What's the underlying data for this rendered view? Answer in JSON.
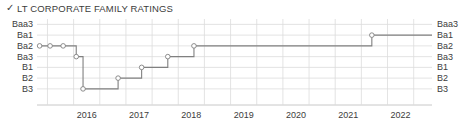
{
  "title": {
    "check_icon": "✓",
    "text": "LT CORPORATE FAMILY RATINGS"
  },
  "colors": {
    "line": "#808080",
    "marker_fill": "#ffffff",
    "marker_stroke": "#808080",
    "grid": "#dcdcdc",
    "axis": "#c8c8c8",
    "text": "#3c3c3c"
  },
  "chart_data": {
    "type": "line",
    "title": "LT CORPORATE FAMILY RATINGS",
    "xlabel": "",
    "ylabel": "",
    "step": "post",
    "grid": true,
    "legend": false,
    "y_categories": [
      "Baa3",
      "Ba1",
      "Ba2",
      "Ba3",
      "B1",
      "B2",
      "B3"
    ],
    "y_axis_labels_left": [
      "Baa3",
      "Ba1",
      "Ba2",
      "Ba3",
      "B1",
      "B2",
      "B3"
    ],
    "y_axis_labels_right": [
      "Baa3",
      "Ba1",
      "Ba2",
      "Ba3",
      "B1",
      "B2",
      "B3"
    ],
    "y_order": "descending_credit_quality",
    "x_tick_labels": [
      "2016",
      "2017",
      "2018",
      "2019",
      "2020",
      "2021",
      "2022"
    ],
    "xlim": [
      "2015.30",
      "2022.85"
    ],
    "series": [
      {
        "name": "LT Corporate Family Rating",
        "points": [
          {
            "x": "2015.35",
            "rating": "Ba2",
            "marker": true
          },
          {
            "x": "2015.55",
            "rating": "Ba2",
            "marker": true
          },
          {
            "x": "2015.80",
            "rating": "Ba2",
            "marker": true
          },
          {
            "x": "2016.05",
            "rating": "Ba3",
            "marker": true
          },
          {
            "x": "2016.18",
            "rating": "B3",
            "marker": true
          },
          {
            "x": "2016.85",
            "rating": "B2",
            "marker": true
          },
          {
            "x": "2017.30",
            "rating": "B1",
            "marker": true
          },
          {
            "x": "2017.80",
            "rating": "Ba3",
            "marker": true
          },
          {
            "x": "2018.30",
            "rating": "Ba2",
            "marker": true
          },
          {
            "x": "2021.70",
            "rating": "Ba1",
            "marker": true
          },
          {
            "x": "2022.85",
            "rating": "Ba1",
            "marker": false
          }
        ]
      }
    ]
  }
}
